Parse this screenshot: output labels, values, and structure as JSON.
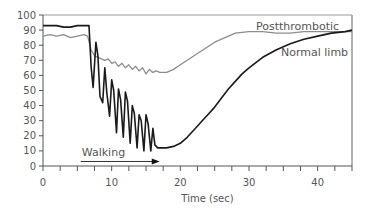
{
  "chart_data": {
    "type": "line",
    "title": "",
    "xlabel": "Time (sec)",
    "ylabel": "",
    "xlim": [
      0,
      45
    ],
    "ylim": [
      0,
      100
    ],
    "xticks_major": [
      0,
      10,
      20,
      30,
      40
    ],
    "xticks_minor_step": 2.5,
    "yticks": [
      0,
      10,
      20,
      30,
      40,
      50,
      60,
      70,
      80,
      90,
      100
    ],
    "grid": false,
    "legend": "inline labels (top-right)",
    "series": [
      {
        "name": "Postthrombotic",
        "label": "Postthrombotic",
        "color": "#8c8c8c",
        "x": [
          0,
          1,
          2,
          3,
          4,
          5,
          6,
          6.5,
          7,
          7.5,
          8,
          8.5,
          9,
          9.5,
          10,
          10.5,
          11,
          11.5,
          12,
          12.5,
          13,
          13.5,
          14,
          14.5,
          15,
          15.5,
          16,
          16.5,
          17,
          18,
          19,
          20,
          21,
          22,
          23,
          24,
          25,
          26,
          27,
          28,
          30,
          32,
          34,
          36,
          38,
          40,
          42,
          44,
          45
        ],
        "y": [
          86,
          87,
          86,
          87,
          85,
          86,
          87,
          86,
          77,
          73,
          72,
          71,
          70,
          71,
          68,
          69,
          66,
          68,
          65,
          67,
          64,
          66,
          63,
          65,
          61,
          64,
          62,
          63,
          62,
          62,
          64,
          67,
          70,
          73,
          76,
          79,
          82,
          84,
          86,
          88,
          89,
          89,
          88,
          88,
          89,
          89,
          89,
          89,
          89
        ]
      },
      {
        "name": "Normal limb",
        "label": "Normal limb",
        "color": "#1a1a1a",
        "x": [
          0,
          1,
          2,
          3,
          4,
          5,
          6,
          6.7,
          7,
          7.3,
          7.7,
          8,
          8.3,
          8.7,
          9,
          9.3,
          9.7,
          10,
          10.3,
          10.7,
          11,
          11.3,
          11.7,
          12,
          12.3,
          12.7,
          13,
          13.3,
          13.7,
          14,
          14.3,
          14.7,
          15,
          15.3,
          15.7,
          16,
          16.3,
          16.7,
          17,
          18,
          19,
          20,
          21,
          22,
          23,
          24,
          25,
          26,
          27,
          28,
          29,
          30,
          32,
          34,
          36,
          38,
          40,
          42,
          44,
          45
        ],
        "y": [
          93,
          93,
          93,
          92,
          92,
          93,
          93,
          93,
          66,
          52,
          82,
          73,
          46,
          42,
          65,
          48,
          33,
          57,
          50,
          22,
          51,
          44,
          19,
          49,
          43,
          15,
          40,
          35,
          12,
          34,
          30,
          10,
          34,
          28,
          10,
          25,
          14,
          12,
          12,
          12,
          13,
          15,
          19,
          24,
          29,
          34,
          39,
          45,
          51,
          56,
          61,
          65,
          72,
          77,
          81,
          84,
          86,
          88,
          89,
          90
        ]
      }
    ],
    "annotations": [
      {
        "text": "Walking",
        "type": "arrow",
        "x_start": 5.5,
        "x_end": 17,
        "y": 3
      }
    ]
  }
}
